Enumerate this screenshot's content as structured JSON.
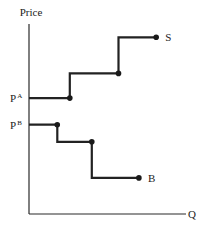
{
  "chart_data": {
    "type": "line",
    "title": "",
    "xlabel": "Q",
    "ylabel": "Price",
    "grid": false,
    "legend": "none",
    "xlim": [
      0,
      10
    ],
    "ylim": [
      0,
      10
    ],
    "price_levels": [
      {
        "name": "P",
        "superscript": "A",
        "value": 6.1
      },
      {
        "name": "P",
        "superscript": "B",
        "value": 4.7
      }
    ],
    "series": [
      {
        "name": "S",
        "label": "S",
        "shape": "step-up",
        "points": [
          [
            0,
            6.1
          ],
          [
            2.6,
            6.1
          ],
          [
            2.6,
            7.4
          ],
          [
            5.7,
            7.4
          ],
          [
            5.7,
            9.3
          ],
          [
            8.1,
            9.3
          ]
        ],
        "markers": [
          [
            2.6,
            6.1
          ],
          [
            5.7,
            7.4
          ],
          [
            8.1,
            9.3
          ]
        ]
      },
      {
        "name": "B",
        "label": "B",
        "shape": "step-down",
        "points": [
          [
            0,
            4.7
          ],
          [
            1.8,
            4.7
          ],
          [
            1.8,
            3.8
          ],
          [
            4.0,
            3.8
          ],
          [
            4.0,
            1.9
          ],
          [
            7.0,
            1.9
          ]
        ],
        "markers": [
          [
            1.8,
            4.7
          ],
          [
            4.0,
            3.8
          ],
          [
            7.0,
            1.9
          ]
        ]
      }
    ],
    "color": "#222222"
  }
}
